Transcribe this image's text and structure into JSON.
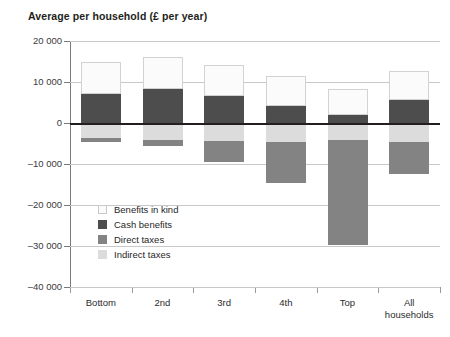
{
  "chart_data": {
    "type": "bar",
    "title": "Average per household (£ per year)",
    "xlabel": "",
    "ylabel": "",
    "ylim": [
      -40000,
      20000
    ],
    "ytick_step": 10000,
    "ytick_labels": [
      "20 000",
      "10 000",
      "0",
      "–10 000",
      "–20 000",
      "–30 000",
      "–40 000"
    ],
    "ytick_values": [
      20000,
      10000,
      0,
      -10000,
      -20000,
      -30000,
      -40000
    ],
    "grid": true,
    "stacked": true,
    "legend_position": "inside-lower-left",
    "categories": [
      "Bottom",
      "2nd",
      "3rd",
      "4th",
      "Top",
      "All\nhouseholds"
    ],
    "category_labels": [
      "Bottom",
      "2nd",
      "3rd",
      "4th",
      "Top",
      "All households"
    ],
    "series": [
      {
        "name": "Benefits in kind",
        "color": "#fbfbfb",
        "values": [
          7900,
          7700,
          7400,
          7300,
          6200,
          7000
        ]
      },
      {
        "name": "Cash benefits",
        "color": "#4d4d4d",
        "values": [
          7100,
          8300,
          6700,
          4200,
          2000,
          5700
        ]
      },
      {
        "name": "Indirect taxes",
        "color": "#dcdcdc",
        "values": [
          -3700,
          -4200,
          -4400,
          -4700,
          -4200,
          -4700
        ]
      },
      {
        "name": "Direct taxes",
        "color": "#838383",
        "values": [
          -1000,
          -1500,
          -5100,
          -10000,
          -25600,
          -7800
        ]
      }
    ],
    "totals_positive": [
      15000,
      16000,
      14100,
      11500,
      8200,
      12700
    ],
    "totals_negative": [
      -4700,
      -5700,
      -9500,
      -14700,
      -29800,
      -12500
    ]
  },
  "legend": {
    "items": [
      {
        "label": "Benefits in kind",
        "swatch": "kind"
      },
      {
        "label": "Cash benefits",
        "swatch": "cash"
      },
      {
        "label": "Direct taxes",
        "swatch": "direct"
      },
      {
        "label": "Indirect taxes",
        "swatch": "indirect"
      }
    ]
  }
}
